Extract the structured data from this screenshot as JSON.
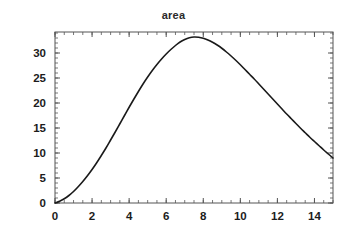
{
  "chart_data": {
    "type": "line",
    "title": "area",
    "xlabel": "",
    "ylabel": "",
    "xlim": [
      0,
      15
    ],
    "ylim": [
      0,
      34.2
    ],
    "grid": false,
    "legend": null,
    "line_color": "#1a1a1a",
    "frame_color": "#555555",
    "background_color": "#ffffff",
    "x_ticks": [
      0,
      2,
      4,
      6,
      8,
      10,
      12,
      14
    ],
    "x_tick_labels": [
      "0",
      "2",
      "4",
      "6",
      "8",
      "10",
      "12",
      "14"
    ],
    "x_minor_tick_step": 0.5,
    "y_ticks": [
      0,
      5,
      10,
      15,
      20,
      25,
      30
    ],
    "y_tick_labels": [
      "0",
      "5",
      "10",
      "15",
      "20",
      "25",
      "30"
    ],
    "y_minor_tick_step": 1,
    "series": [
      {
        "name": "area",
        "x": [
          0.0,
          0.25,
          0.5,
          0.75,
          1.0,
          1.25,
          1.5,
          1.75,
          2.0,
          2.25,
          2.5,
          2.75,
          3.0,
          3.25,
          3.5,
          3.75,
          4.0,
          4.25,
          4.5,
          4.75,
          5.0,
          5.25,
          5.5,
          5.75,
          6.0,
          6.25,
          6.5,
          6.75,
          7.0,
          7.25,
          7.5,
          7.75,
          8.0,
          8.25,
          8.5,
          8.75,
          9.0,
          9.25,
          9.5,
          9.75,
          10.0,
          10.25,
          10.5,
          10.75,
          11.0,
          11.25,
          11.5,
          11.75,
          12.0,
          12.25,
          12.5,
          12.75,
          13.0,
          13.25,
          13.5,
          13.75,
          14.0,
          14.25,
          14.5,
          14.75,
          15.0
        ],
        "y": [
          0.0,
          0.35,
          0.85,
          1.5,
          2.3,
          3.25,
          4.3,
          5.45,
          6.7,
          8.05,
          9.5,
          11.0,
          12.6,
          14.2,
          15.85,
          17.5,
          19.15,
          20.75,
          22.3,
          23.8,
          25.2,
          26.5,
          27.7,
          28.8,
          29.8,
          30.7,
          31.5,
          32.2,
          32.7,
          33.05,
          33.2,
          33.15,
          32.95,
          32.6,
          32.15,
          31.6,
          30.95,
          30.2,
          29.4,
          28.55,
          27.65,
          26.7,
          25.75,
          24.8,
          23.8,
          22.8,
          21.8,
          20.8,
          19.8,
          18.8,
          17.8,
          16.85,
          15.9,
          14.95,
          14.05,
          13.15,
          12.3,
          11.45,
          10.6,
          9.8,
          9.0
        ],
        "peak_x": 7.5,
        "peak_y": 33.2,
        "start_point": [
          0.0,
          0.0
        ],
        "end_point": [
          15.0,
          9.0
        ]
      }
    ]
  }
}
